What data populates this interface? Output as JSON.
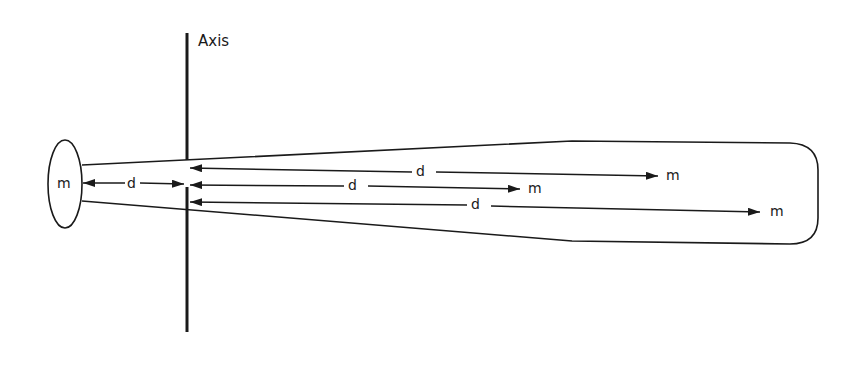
{
  "diagram": {
    "labels": {
      "axis": "Axis",
      "mass_left": "m",
      "dist_left": "d",
      "dist_top": "d",
      "mass_top": "m",
      "dist_middle": "d",
      "mass_middle": "m",
      "dist_bottom": "d",
      "mass_bottom": "m"
    },
    "colors": {
      "stroke": "#1a1a1a",
      "background": "#ffffff"
    },
    "elements": {
      "axis_line": {
        "x": 187,
        "y1": 33,
        "y2": 332
      },
      "end_mass_ellipse": {
        "cx": 65,
        "cy": 184,
        "rx": 17,
        "ry": 44
      },
      "bat_outline": {
        "top_left": [
          82,
          165
        ],
        "top_bend": [
          572,
          141
        ],
        "bottom_left": [
          82,
          201
        ],
        "bottom_bend": [
          572,
          241
        ],
        "right_edge_x": 818
      },
      "arrows": [
        {
          "name": "left-arrow",
          "from": [
            185,
            184
          ],
          "to": [
            82,
            184
          ],
          "double": true
        },
        {
          "name": "top-arrow",
          "from": [
            660,
            176
          ],
          "to": [
            190,
            168
          ]
        },
        {
          "name": "middle-arrow",
          "from": [
            520,
            189
          ],
          "to": [
            190,
            185
          ]
        },
        {
          "name": "bottom-arrow",
          "from": [
            762,
            212
          ],
          "to": [
            190,
            202
          ]
        }
      ]
    }
  }
}
